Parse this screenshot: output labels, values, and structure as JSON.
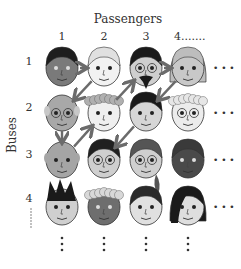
{
  "title": "Passengers",
  "y_label": "Buses",
  "columns": [
    "1",
    "2",
    "3",
    "4......."
  ],
  "rows": [
    "1",
    "2",
    "3",
    "4"
  ],
  "row4_continuation": "......",
  "ellipsis_right": "• • •",
  "ellipsis_down": "⋮",
  "colors": {
    "arrow": "#6b6b6b",
    "background": "#ffffff",
    "text": "#333333"
  },
  "faces": [
    [
      {
        "skin": "#7a7a7a",
        "hair": "#1e1e1e",
        "style": "short"
      },
      {
        "skin": "#f2f2f2",
        "hair": "#e0e0e0",
        "style": "white-short"
      },
      {
        "skin": "#cfcfcf",
        "hair": "#1a1a1a",
        "style": "dark-beard"
      },
      {
        "skin": "#c8c8c8",
        "hair": "#bdbdbd",
        "style": "long-grey"
      }
    ],
    [
      {
        "skin": "#a8a8a8",
        "hair": "#c8c8c8",
        "style": "bald-glasses"
      },
      {
        "skin": "#efefef",
        "hair": "#b0b0b0",
        "style": "curly"
      },
      {
        "skin": "#d6d6d6",
        "hair": "#1a1a1a",
        "style": "bob"
      },
      {
        "skin": "#ececec",
        "hair": "#e6e6e6",
        "style": "white-curly-glasses"
      }
    ],
    [
      {
        "skin": "#a5a5a5",
        "hair": "#a5a5a5",
        "style": "bald"
      },
      {
        "skin": "#cfcfcf",
        "hair": "#202020",
        "style": "dark-glasses"
      },
      {
        "skin": "#cfcfcf",
        "hair": "#555555",
        "style": "ponytail-glasses"
      },
      {
        "skin": "#4a4a4a",
        "hair": "#3a3a3a",
        "style": "dark"
      }
    ],
    [
      {
        "skin": "#cfcfcf",
        "hair": "#1a1a1a",
        "style": "spiky"
      },
      {
        "skin": "#6e6e6e",
        "hair": "#d8d8d8",
        "style": "curly-dark"
      },
      {
        "skin": "#e0e0e0",
        "hair": "#2a2a2a",
        "style": "short-dark"
      },
      {
        "skin": "#dedede",
        "hair": "#1a1a1a",
        "style": "long-side"
      }
    ]
  ],
  "path": [
    [
      1,
      1
    ],
    [
      1,
      2
    ],
    [
      2,
      1
    ],
    [
      3,
      1
    ],
    [
      2,
      2
    ],
    [
      1,
      3
    ],
    [
      1,
      4
    ],
    [
      2,
      3
    ],
    [
      3,
      2
    ]
  ]
}
